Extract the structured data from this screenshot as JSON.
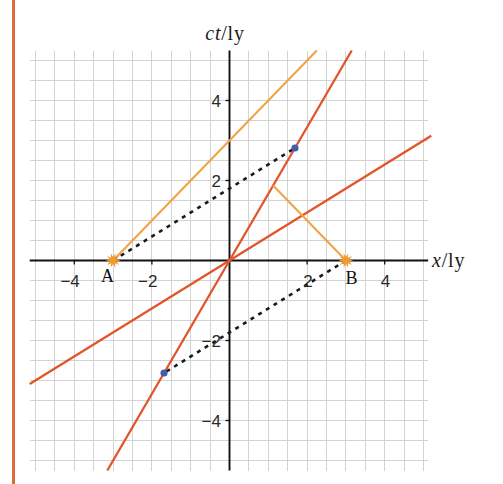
{
  "figure": {
    "y_axis_label": {
      "var": "ct",
      "unit": "/ly"
    },
    "x_axis_label": {
      "var": "x",
      "unit": "/ly"
    }
  },
  "colors": {
    "frame_rule": "#dc6a3c",
    "moving_frame_axes": "#e2552a",
    "light_rays": "#f0a545",
    "simultaneity": "#1a1a1a",
    "event_marker": "#f39a2c",
    "intersection_dot": "#3f5fa8"
  },
  "chart_data": {
    "type": "line",
    "title": "",
    "xlabel": "x/ly",
    "ylabel": "ct/ly",
    "xlim": [
      -5.15,
      5.12
    ],
    "ylim": [
      -5.25,
      5.25
    ],
    "grid": true,
    "grid_step": 0.5,
    "legend": null,
    "x_ticks": [
      {
        "value": -4,
        "label": "−4"
      },
      {
        "value": -2,
        "label": "−2"
      },
      {
        "value": 2,
        "label": "2"
      },
      {
        "value": 4,
        "label": "4"
      }
    ],
    "y_ticks": [
      {
        "value": 4,
        "label": "4"
      },
      {
        "value": 2,
        "label": "2"
      },
      {
        "value": -2,
        "label": "−2"
      },
      {
        "value": -4,
        "label": "−4"
      }
    ],
    "series": [
      {
        "id": "ct-prime-axis",
        "name": "ct′ axis (worldline of frame moving at v = 0.6c)",
        "slope": 1.6667,
        "color_key": "moving_frame_axes",
        "style": "solid",
        "width": 2.3,
        "points": [
          [
            -3.15,
            -5.25
          ],
          [
            3.15,
            5.25
          ]
        ]
      },
      {
        "id": "x-prime-axis",
        "name": "x′ axis",
        "slope": 0.6,
        "color_key": "moving_frame_axes",
        "style": "solid",
        "width": 2.3,
        "points": [
          [
            -5.15,
            -3.09
          ],
          [
            5.2,
            3.12
          ]
        ]
      },
      {
        "id": "light-ray-a",
        "name": "light signal from A",
        "slope": 1,
        "color_key": "light_rays",
        "style": "solid",
        "width": 2.1,
        "points": [
          [
            -3,
            0
          ],
          [
            2.25,
            5.25
          ]
        ]
      },
      {
        "id": "light-ray-b",
        "name": "light signal from B",
        "slope": -1,
        "color_key": "light_rays",
        "style": "solid",
        "width": 2.1,
        "points": [
          [
            3,
            0
          ],
          [
            1.125,
            1.875
          ]
        ]
      },
      {
        "id": "simultaneity-a",
        "name": "line of simultaneity through A",
        "slope": 0.6,
        "color_key": "simultaneity",
        "style": "dashed",
        "width": 2.6,
        "points": [
          [
            -3,
            0
          ],
          [
            1.6875,
            2.8125
          ]
        ]
      },
      {
        "id": "simultaneity-b",
        "name": "line of simultaneity through B",
        "slope": 0.6,
        "color_key": "simultaneity",
        "style": "dashed",
        "width": 2.6,
        "points": [
          [
            3,
            0
          ],
          [
            -1.6875,
            -2.8125
          ]
        ]
      }
    ],
    "events": [
      {
        "label": "A",
        "x": -3,
        "ct": 0,
        "marker": "star",
        "label_position": "below-left"
      },
      {
        "label": "B",
        "x": 3,
        "ct": 0,
        "marker": "star",
        "label_position": "below-right"
      }
    ],
    "points": [
      {
        "x": 1.6875,
        "ct": 2.8125,
        "marker": "dot"
      },
      {
        "x": -1.6875,
        "ct": -2.8125,
        "marker": "dot"
      }
    ]
  }
}
